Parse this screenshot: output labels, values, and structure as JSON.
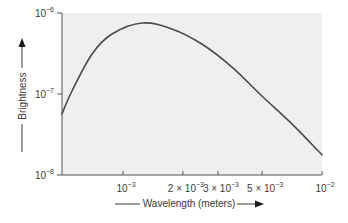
{
  "chart_data": {
    "type": "line",
    "title": "",
    "xlabel": "Wavelength (meters)",
    "ylabel": "Brightness",
    "xscale": "log",
    "yscale": "log",
    "xlim": [
      0.00049,
      0.01
    ],
    "ylim": [
      1e-08,
      1e-06
    ],
    "grid": false,
    "legend": null,
    "x_ticks": [
      {
        "value": 0.001,
        "base": "10",
        "exp": "−3",
        "prefix": ""
      },
      {
        "value": 0.002,
        "base": "10",
        "exp": "−3",
        "prefix": "2 × "
      },
      {
        "value": 0.003,
        "base": "10",
        "exp": "−3",
        "prefix": "3 × "
      },
      {
        "value": 0.005,
        "base": "10",
        "exp": "−3",
        "prefix": "5 × "
      },
      {
        "value": 0.01,
        "base": "10",
        "exp": "−2",
        "prefix": ""
      }
    ],
    "y_ticks": [
      {
        "value": 1e-06,
        "base": "10",
        "exp": "−6"
      },
      {
        "value": 1e-07,
        "base": "10",
        "exp": "−7"
      },
      {
        "value": 1e-08,
        "base": "10",
        "exp": "−8"
      }
    ],
    "series": [
      {
        "name": "Brightness vs Wavelength",
        "color": "#4a4a4a",
        "x": [
          0.000493,
          0.000554,
          0.000699,
          0.00088,
          0.00125,
          0.00176,
          0.00249,
          0.00353,
          0.00499,
          0.00706,
          0.01
        ],
        "y": [
          5.66e-08,
          1.09e-07,
          3.12e-07,
          5.5e-07,
          7.53e-07,
          6.34e-07,
          4.14e-07,
          2.15e-07,
          9.44e-08,
          4.27e-08,
          1.77e-08
        ]
      }
    ],
    "colors": {
      "plot_background": "#efefef",
      "axis": "#555555",
      "text": "#3a3a3a"
    }
  }
}
